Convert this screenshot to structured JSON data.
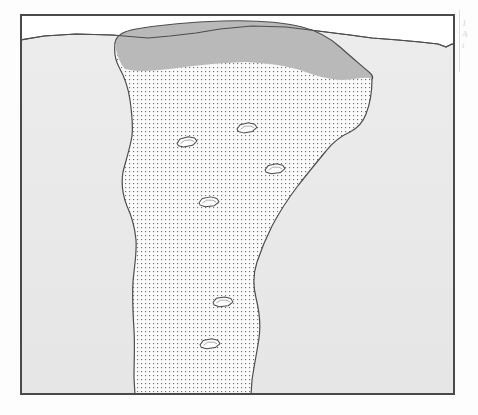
{
  "figure": {
    "kind": "geological-cross-section",
    "caption": "",
    "frame": {
      "x": 20,
      "y": 14,
      "width": 435,
      "height": 381,
      "border_color": "#4a4a4a",
      "border_width": 2,
      "background": "#ffffff"
    },
    "palette": {
      "paper": "#ffffff",
      "sky_void": "#ffffff",
      "host_soil_fill": "#e9e9e9",
      "host_soil_line": "#4d4d4d",
      "surface_lens_fill": "#b9b9b9",
      "surface_lens_line": "#4d4d4d",
      "pipe_fill": "#fbfbfb",
      "pipe_line": "#4d4d4d",
      "stipple_dot": "#6f6f6f",
      "clast_fill": "#fdfdfd",
      "clast_line": "#4a4a4a"
    },
    "layers": [
      {
        "id": "host-soil",
        "label": "host sediment",
        "fill": "#e9e9e9",
        "description": "undifferentiated host deposit filling the section below the ground surface"
      },
      {
        "id": "surface-lens",
        "label": "surface lens",
        "fill": "#b9b9b9",
        "description": "darker grey lens capping the pipe at the ground surface"
      },
      {
        "id": "pipe-fill",
        "label": "stippled pipe fill",
        "fill": "#fbfbfb",
        "pattern": "stipple-dots",
        "description": "funnel-shaped, downward-tapering stippled body reaching the base of the frame"
      },
      {
        "id": "clasts",
        "label": "clasts",
        "fill": "#fdfdfd",
        "count": 6,
        "description": "small angular hexagonal clasts floating within the stippled pipe fill"
      }
    ],
    "ground_surface": {
      "label": "ground surface",
      "style": "undulating line",
      "points": "0,26 24,22 56,20 92,21 128,24 150,22 176,19 200,15 232,12 266,13 298,17 330,21 352,24 378,26 400,28 418,30 426,33 432,30 435,31"
    },
    "surface_lens_outline": {
      "label": "surface lens outline",
      "points": "95,27 112,23 140,19 172,16 206,13 240,12 268,13 290,16 304,21 316,27 326,34 336,41 344,47 350,52 352,56 348,60 338,63 324,64 308,63 296,60 286,56 272,52 252,49 228,48 200,49 174,52 152,55 134,57 120,57 108,54 99,48 94,40 93,33"
    },
    "pipe_outline": {
      "label": "stippled pipe outline",
      "points": "95,29 94,42 98,52 104,60 108,72 110,86 112,100 113,114 110,128 107,140 104,152 102,164 103,176 106,186 110,196 114,206 116,218 116,232 114,246 113,262 112,278 113,294 114,310 115,326 114,342 113,356 114,368 116,378 116,381 230,381 231,370 233,356 236,344 239,332 240,320 240,308 238,296 235,284 233,272 233,260 236,248 240,236 244,226 248,216 253,206 258,196 264,186 271,176 279,166 288,156 296,147 303,138 309,130 316,124 324,120 331,117 337,113 341,107 345,100 348,92 350,84 352,74 352,63 346,61 336,64 322,65 307,64 295,61 284,57 270,53 250,50 226,49 198,50 172,53 150,56 132,58 118,58 106,55 99,49"
    },
    "clasts": [
      {
        "id": "clast-1",
        "cx": 227,
        "cy": 114,
        "rx": 10,
        "ry": 5,
        "rotate": -6
      },
      {
        "id": "clast-2",
        "cx": 167,
        "cy": 128,
        "rx": 10,
        "ry": 5,
        "rotate": -8
      },
      {
        "id": "clast-3",
        "cx": 255,
        "cy": 155,
        "rx": 10,
        "ry": 5,
        "rotate": -5
      },
      {
        "id": "clast-4",
        "cx": 189,
        "cy": 188,
        "rx": 10,
        "ry": 5,
        "rotate": -4
      },
      {
        "id": "clast-5",
        "cx": 203,
        "cy": 288,
        "rx": 10,
        "ry": 5,
        "rotate": -3
      },
      {
        "id": "clast-6",
        "cx": 190,
        "cy": 330,
        "rx": 10,
        "ry": 5,
        "rotate": -5
      }
    ],
    "margin_bleed": {
      "label": "adjacent page text bleed",
      "lines": [
        "1",
        "A",
        "t"
      ]
    }
  }
}
